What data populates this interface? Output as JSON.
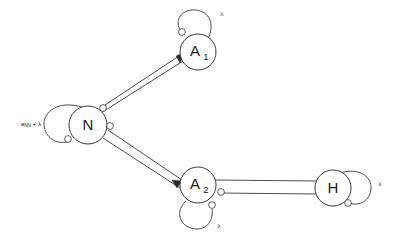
{
  "figure": {
    "background_color": "#ffffff",
    "stroke_color": "#3a3a3a",
    "text_color": "#1c1c1c"
  },
  "nodes": [
    {
      "id": "N",
      "label": "N",
      "sub": "",
      "cx": 88,
      "cy": 125,
      "r": 19
    },
    {
      "id": "A1",
      "label": "A",
      "sub": "1",
      "cx": 198,
      "cy": 52,
      "r": 18
    },
    {
      "id": "A2",
      "label": "A",
      "sub": "2",
      "cx": 198,
      "cy": 185,
      "r": 18
    },
    {
      "id": "H",
      "label": "H",
      "sub": "",
      "cx": 333,
      "cy": 188,
      "r": 18
    }
  ],
  "self_loops": [
    {
      "node": "N",
      "label": "λ",
      "label_x": 44,
      "label_y": 124,
      "side": "left"
    },
    {
      "node": "A1",
      "label": "λ",
      "label_x": 222,
      "label_y": 14,
      "side": "top"
    },
    {
      "node": "A2",
      "label": "λ",
      "label_x": 219,
      "label_y": 226,
      "side": "bottom"
    },
    {
      "node": "H",
      "label": "λ",
      "label_x": 380,
      "label_y": 184,
      "side": "right"
    }
  ],
  "edge_labels": {
    "n_self_weight_main": "a",
    "n_self_weight_sub": "NN",
    "n_self_weight_plus": " + ",
    "n_self_weight_lambda": "λ",
    "n_self_weight_full": "a_NN + λ"
  },
  "edges": [
    {
      "from": "N",
      "to": "A1",
      "kind": "arrow-pair",
      "terminal": "inhibitory-circle"
    },
    {
      "from": "N",
      "to": "A2",
      "kind": "arrow-pair",
      "terminal": "inhibitory-circle"
    },
    {
      "from": "A2",
      "to": "H",
      "kind": "line-pair",
      "terminal": "inhibitory-circle"
    }
  ],
  "terminals": [
    {
      "name": "n-to-a1-terminal",
      "cx": 103,
      "cy": 108,
      "r": 3.4
    },
    {
      "name": "n-to-a2-terminal",
      "cx": 110,
      "cy": 126,
      "r": 3.4
    },
    {
      "name": "n-self-terminal",
      "cx": 68,
      "cy": 138,
      "r": 3.4
    },
    {
      "name": "a1-self-terminal",
      "cx": 183,
      "cy": 33,
      "r": 3.4
    },
    {
      "name": "a2-self-terminal",
      "cx": 212,
      "cy": 205,
      "r": 3.4
    },
    {
      "name": "a2-to-h-terminal",
      "cx": 222,
      "cy": 191,
      "r": 3.4
    },
    {
      "name": "h-self-terminal",
      "cx": 348,
      "cy": 202,
      "r": 3.4
    }
  ]
}
